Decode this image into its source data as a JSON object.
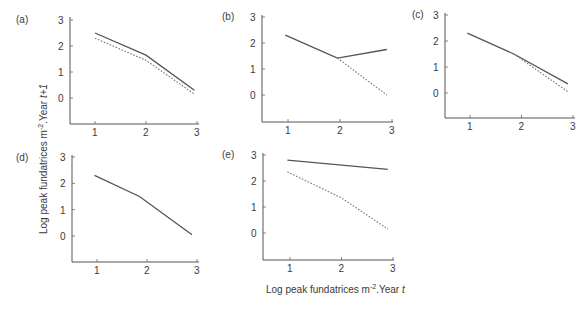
{
  "figure": {
    "ylabel": "Log peak fundatrices m",
    "ylabel_sup": "-2",
    "ylabel_suffix": ".Year ",
    "ylabel_italic": "t+1",
    "xlabel": "Log peak fundatrices m",
    "xlabel_sup": "-2",
    "xlabel_suffix": ".Year ",
    "xlabel_italic": "t"
  },
  "chart_data": [
    {
      "panel": "(a)",
      "type": "line",
      "xlim": [
        0.5,
        3
      ],
      "ylim": [
        -1,
        3
      ],
      "xticks": [
        1,
        2,
        3
      ],
      "yticks": [
        0,
        1,
        2,
        3
      ],
      "frame": {
        "x0": 70,
        "y_axis_top": 17,
        "y_bottom": 124,
        "x_right": 199,
        "px1": 95,
        "px2": 147,
        "px3": 197,
        "py0": 98,
        "py1": 72,
        "py2": 45,
        "py3": 20
      },
      "series": [
        {
          "name": "solid",
          "style": "solid",
          "points": [
            [
              1.0,
              2.5
            ],
            [
              2.0,
              1.65
            ],
            [
              2.95,
              0.3
            ]
          ]
        },
        {
          "name": "dotted",
          "style": "dotted",
          "points": [
            [
              1.0,
              2.3
            ],
            [
              2.0,
              1.45
            ],
            [
              2.95,
              0.15
            ]
          ]
        }
      ]
    },
    {
      "panel": "(b)",
      "type": "line",
      "xlim": [
        0.5,
        3
      ],
      "ylim": [
        -1,
        3
      ],
      "xticks": [
        1,
        2,
        3
      ],
      "yticks": [
        0,
        1,
        2,
        3
      ],
      "frame": {
        "x0": 262,
        "y_axis_top": 15,
        "y_bottom": 122,
        "x_right": 393,
        "px1": 288,
        "px2": 340,
        "px3": 392,
        "py0": 95,
        "py1": 69,
        "py2": 43,
        "py3": 17
      },
      "series": [
        {
          "name": "solid",
          "style": "solid",
          "points": [
            [
              0.95,
              2.3
            ],
            [
              1.95,
              1.42
            ],
            [
              2.9,
              1.75
            ]
          ]
        },
        {
          "name": "dotted",
          "style": "dotted",
          "points": [
            [
              1.95,
              1.42
            ],
            [
              2.9,
              0.0
            ]
          ]
        }
      ]
    },
    {
      "panel": "(c)",
      "type": "line",
      "xlim": [
        0.5,
        3
      ],
      "ylim": [
        -1,
        3
      ],
      "xticks": [
        1,
        2,
        3
      ],
      "yticks": [
        0,
        1,
        2,
        3
      ],
      "frame": {
        "x0": 445,
        "y_axis_top": 13,
        "y_bottom": 118,
        "x_right": 575,
        "px1": 470,
        "px2": 523,
        "px3": 573,
        "py0": 93,
        "py1": 67,
        "py2": 41,
        "py3": 15
      },
      "series": [
        {
          "name": "solid",
          "style": "solid",
          "points": [
            [
              0.95,
              2.3
            ],
            [
              1.85,
              1.5
            ],
            [
              2.9,
              0.35
            ]
          ]
        },
        {
          "name": "dotted",
          "style": "dotted",
          "points": [
            [
              1.85,
              1.5
            ],
            [
              2.9,
              0.05
            ]
          ]
        }
      ]
    },
    {
      "panel": "(d)",
      "type": "line",
      "xlim": [
        0.5,
        3
      ],
      "ylim": [
        -1,
        3
      ],
      "xticks": [
        1,
        2,
        3
      ],
      "yticks": [
        0,
        1,
        2,
        3
      ],
      "frame": {
        "x0": 72,
        "y_axis_top": 155,
        "y_bottom": 262,
        "x_right": 199,
        "px1": 97,
        "px2": 148,
        "px3": 197,
        "py0": 236,
        "py1": 210,
        "py2": 183,
        "py3": 157
      },
      "series": [
        {
          "name": "solid",
          "style": "solid",
          "points": [
            [
              0.95,
              2.3
            ],
            [
              1.85,
              1.5
            ],
            [
              2.9,
              0.05
            ]
          ]
        }
      ]
    },
    {
      "panel": "(e)",
      "type": "line",
      "xlim": [
        0.5,
        3
      ],
      "ylim": [
        -1,
        3
      ],
      "xticks": [
        1,
        2,
        3
      ],
      "yticks": [
        0,
        1,
        2,
        3
      ],
      "frame": {
        "x0": 263,
        "y_axis_top": 153,
        "y_bottom": 260,
        "x_right": 394,
        "px1": 290,
        "px2": 342,
        "px3": 393,
        "py0": 233,
        "py1": 208,
        "py2": 182,
        "py3": 155
      },
      "series": [
        {
          "name": "solid",
          "style": "solid",
          "points": [
            [
              0.95,
              2.8
            ],
            [
              2.9,
              2.45
            ]
          ]
        },
        {
          "name": "dotted",
          "style": "dotted",
          "points": [
            [
              0.95,
              2.35
            ],
            [
              2.0,
              1.35
            ],
            [
              2.9,
              0.15
            ]
          ]
        }
      ]
    }
  ],
  "panel_label_pos": [
    {
      "x": 16,
      "y": 23
    },
    {
      "x": 222,
      "y": 20
    },
    {
      "x": 412,
      "y": 18
    },
    {
      "x": 16,
      "y": 161
    },
    {
      "x": 222,
      "y": 158
    }
  ],
  "xlabel_pos": {
    "x": 266,
    "y": 293
  },
  "ylabel_pos": {
    "x": 47,
    "y": 234
  }
}
